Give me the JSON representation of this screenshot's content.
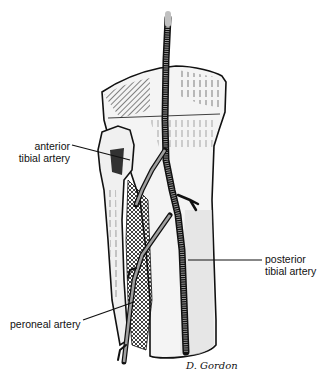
{
  "figure": {
    "colors": {
      "ink": "#111111",
      "bone_fill": "#f2f2f2",
      "shadow": "#d9d9d9",
      "artery_tip": "#c0c0c0",
      "background": "#ffffff"
    }
  },
  "labels": {
    "anterior": {
      "line1": "anterior",
      "line2": "tibial artery"
    },
    "posterior": {
      "line1": "posterior",
      "line2": "tibial artery"
    },
    "peroneal": {
      "text": "peroneal artery"
    }
  },
  "signature": {
    "text": "D. Gordon"
  }
}
